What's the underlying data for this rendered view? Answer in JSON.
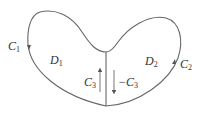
{
  "diagram": {
    "stroke_color": "#666666",
    "labels": {
      "C1": {
        "base": "C",
        "sub": "1"
      },
      "C2": {
        "base": "C",
        "sub": "2"
      },
      "D1": {
        "base": "D",
        "sub": "1"
      },
      "D2": {
        "base": "D",
        "sub": "2"
      },
      "C3": {
        "base": "C",
        "sub": "3"
      },
      "negC3": {
        "base": "−C",
        "sub": "3"
      }
    }
  }
}
